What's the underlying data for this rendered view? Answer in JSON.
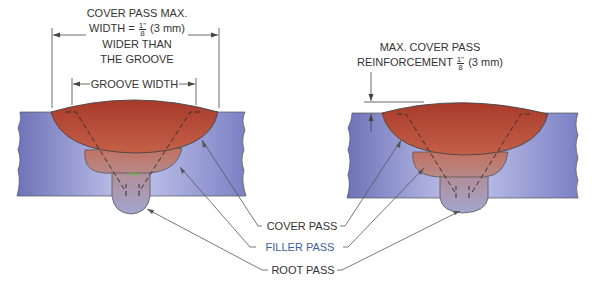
{
  "left_diagram": {
    "cover_width_label": {
      "line1": "COVER PASS MAX.",
      "line2_prefix": "WIDTH =",
      "fraction_num": "1\"",
      "fraction_den": "8",
      "line2_suffix": "(3 mm)",
      "line3": "WIDER THAN",
      "line4": "THE GROOVE"
    },
    "groove_width_label": "GROOVE WIDTH"
  },
  "right_diagram": {
    "reinforcement_label": {
      "line1": "MAX. COVER PASS",
      "line2_prefix": "REINFORCEMENT",
      "fraction_num": "1\"",
      "fraction_den": "8",
      "line2_suffix": "(3 mm)"
    }
  },
  "callouts": {
    "cover_pass": "COVER PASS",
    "filler_pass": "FILLER PASS",
    "root_pass": "ROOT PASS"
  },
  "colors": {
    "base_metal": "#8a8fd0",
    "cover_pass": "#b84a35",
    "filler_pass": "#c07a70",
    "root_pass": "#a79ab8",
    "filler_label": "#3a5fa0",
    "line": "#444444"
  }
}
